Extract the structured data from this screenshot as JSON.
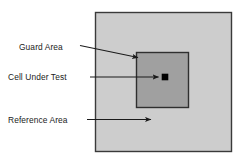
{
  "diagram": {
    "canvas": {
      "width": 242,
      "height": 161,
      "background": "#ffffff"
    },
    "colors": {
      "reference_area_fill": "#cdcdcd",
      "guard_area_fill": "#a0a0a0",
      "cell_under_test_fill": "#000000",
      "border": "#3a3a3a",
      "arrow": "#1a1a1a",
      "text": "#1a1a1a"
    },
    "regions": [
      {
        "key": "reference-area",
        "label": "Reference Area",
        "shape": "square",
        "x": 95,
        "y": 12,
        "width": 137,
        "height": 140,
        "fill": "#cdcdcd"
      },
      {
        "key": "guard-area",
        "label": "Guard Area",
        "shape": "square",
        "x": 136,
        "y": 52,
        "width": 53,
        "height": 56,
        "fill": "#a0a0a0"
      },
      {
        "key": "cell-under-test",
        "label": "Cell Under Test",
        "shape": "square",
        "x": 162,
        "y": 74,
        "width": 6,
        "height": 6,
        "fill": "#000000"
      }
    ],
    "labels": [
      {
        "key": "guard-area",
        "text": "Guard Area",
        "text_x": 19,
        "text_y": 50,
        "leader": {
          "x1": 80,
          "y1": 45.5,
          "x2": 139,
          "y2": 58
        }
      },
      {
        "key": "cell-under-test",
        "text": "Cell Under Test",
        "text_x": 8,
        "text_y": 80,
        "leader": {
          "x1": 90,
          "y1": 77,
          "x2": 159,
          "y2": 77
        }
      },
      {
        "key": "reference-area",
        "text": "Reference Area",
        "text_x": 8,
        "text_y": 123,
        "leader": {
          "x1": 87,
          "y1": 119.5,
          "x2": 152,
          "y2": 119.5
        }
      }
    ]
  }
}
